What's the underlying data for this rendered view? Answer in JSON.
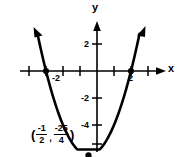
{
  "chart_data": {
    "type": "line",
    "title": "",
    "xlabel": "x",
    "ylabel": "y",
    "xlim": [
      -4.5,
      3.7
    ],
    "ylim": [
      -7.8,
      3.0
    ],
    "grid": false,
    "legend": null,
    "curve": {
      "name": "parabola",
      "equation": "y = x^2 + x - 6",
      "x": [
        -3.55,
        -3.25,
        -3.0,
        -2.75,
        -2.5,
        -2.25,
        -2.0,
        -1.75,
        -1.5,
        -1.25,
        -1.0,
        -0.75,
        -0.5,
        -0.25,
        0.0,
        0.25,
        0.5,
        0.75,
        1.0,
        1.25,
        1.5,
        1.75,
        2.0,
        2.25,
        2.5
      ],
      "y": [
        -1.85,
        -3.69,
        -6.0,
        -0.69,
        -2.75,
        -4.19,
        -4.0,
        -4.69,
        -5.25,
        -5.69,
        -6.0,
        -6.19,
        -6.25,
        -6.19,
        -6.0,
        -5.69,
        -5.25,
        -4.69,
        -4.0,
        -3.19,
        -2.25,
        -1.19,
        0.0,
        1.31,
        2.75
      ]
    },
    "x_ticks": [
      -3,
      -2,
      -1,
      1,
      2,
      3
    ],
    "x_tick_labels": [
      "",
      "-2",
      "",
      "",
      "2",
      ""
    ],
    "y_ticks": [
      2,
      -2,
      -4,
      -6
    ],
    "y_tick_labels": [
      "2",
      "-2",
      "-4",
      ""
    ],
    "points": [
      {
        "name": "x-intercept-left",
        "x": -3,
        "y": 0,
        "label": ""
      },
      {
        "name": "x-intercept-right",
        "x": 2,
        "y": 0,
        "label": ""
      },
      {
        "name": "vertex",
        "x": -0.5,
        "y": -6.25,
        "label": "(-1/2, -25/4)"
      }
    ],
    "annotations": [
      {
        "name": "vertex-coordinate",
        "open_paren": "(",
        "x_numerator": "-1",
        "x_denominator": "2",
        "separator": ",",
        "y_numerator": "-25",
        "y_denominator": "4",
        "close_paren": ")"
      }
    ],
    "colors": {
      "curve": "#000000",
      "axes": "#000000",
      "text": "#000000",
      "background": "#ffffff"
    }
  },
  "axes": {
    "x_name": "x",
    "y_name": "y"
  },
  "ticks": {
    "x_neg2": "-2",
    "x_pos2": "2",
    "y_pos2": "2",
    "y_neg2": "-2",
    "y_neg4": "-4"
  },
  "vertex": {
    "open_paren": "(",
    "x_num": "-1",
    "x_den": "2",
    "comma": ",",
    "y_num": "-25",
    "y_den": "4",
    "close_paren": ")"
  }
}
